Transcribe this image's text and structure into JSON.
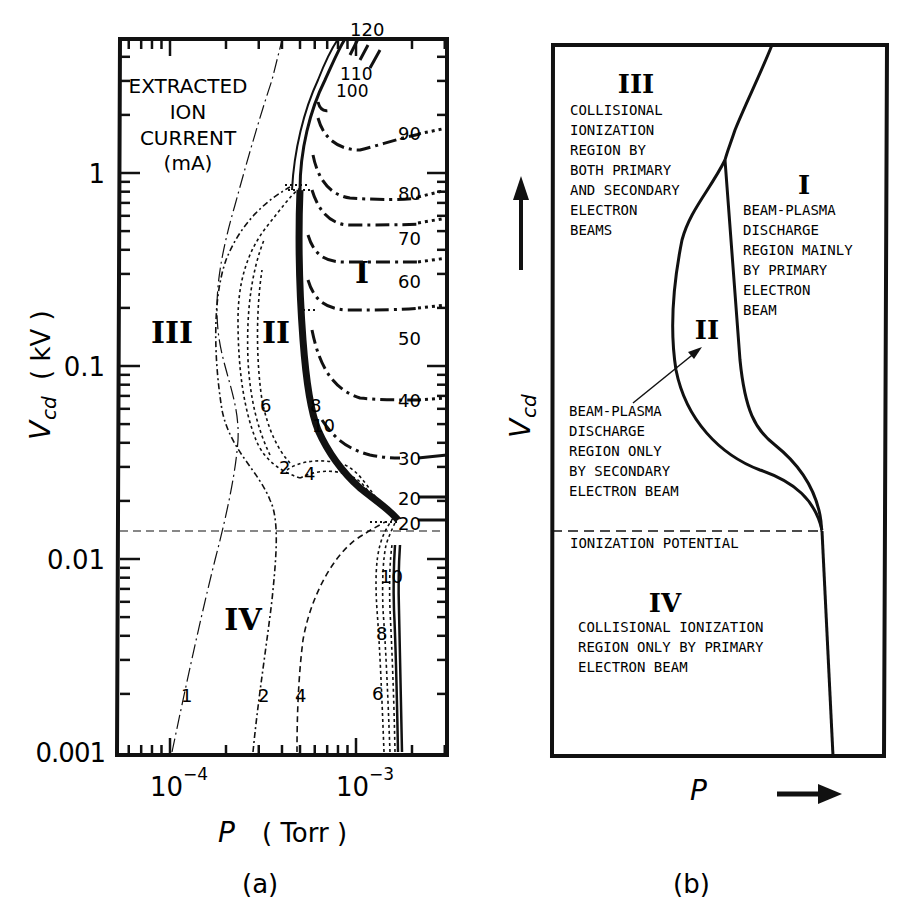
{
  "chart_data": [
    {
      "panel": "a",
      "type": "line",
      "title": "",
      "xlabel": "P (Torr)",
      "ylabel": "Vcd (kV)",
      "xscale": "log",
      "yscale": "log",
      "xlim": [
        5e-05,
        0.003
      ],
      "ylim": [
        0.001,
        5
      ],
      "x_ticks": [
        "10^-4",
        "10^-3"
      ],
      "y_ticks": [
        "0.001",
        "0.01",
        "0.1",
        "1"
      ],
      "legend_title": "EXTRACTED ION CURRENT (mA)",
      "ionization_potential_kV": 0.0145,
      "region_labels": [
        "I",
        "II",
        "III",
        "IV"
      ],
      "series": [
        {
          "name": "1 mA",
          "style": "dashdot-thin",
          "points": [
            [
              0.0001,
              0.001
            ],
            [
              0.00013,
              0.004
            ],
            [
              0.00018,
              0.012
            ],
            [
              0.00022,
              0.03
            ],
            [
              0.00021,
              0.06
            ],
            [
              0.00017,
              0.15
            ],
            [
              0.00018,
              0.35
            ],
            [
              0.00026,
              1.0
            ],
            [
              0.00035,
              2.5
            ],
            [
              0.00042,
              5
            ]
          ]
        },
        {
          "name": "2 mA",
          "style": "dashdot",
          "points": [
            [
              0.00027,
              0.001
            ],
            [
              0.00032,
              0.004
            ],
            [
              0.00036,
              0.012
            ],
            [
              0.00035,
              0.025
            ],
            [
              0.00028,
              0.05
            ],
            [
              0.00025,
              0.1
            ],
            [
              0.00024,
              0.2
            ],
            [
              0.00028,
              0.5
            ],
            [
              0.00038,
              0.85
            ],
            [
              0.00046,
              0.9
            ]
          ]
        },
        {
          "name": "4 mA",
          "style": "dashed",
          "points": [
            [
              0.00048,
              0.001
            ],
            [
              0.0005,
              0.003
            ],
            [
              0.00058,
              0.007
            ],
            [
              0.00085,
              0.013
            ],
            [
              0.00118,
              0.018
            ]
          ]
        },
        {
          "name": "6 mA",
          "style": "dotted-bundle",
          "points": [
            [
              0.00125,
              0.001
            ],
            [
              0.0012,
              0.006
            ],
            [
              0.00123,
              0.017
            ]
          ]
        },
        {
          "name": "8 mA",
          "style": "dotted-bundle",
          "points": [
            [
              0.00135,
              0.001
            ],
            [
              0.0013,
              0.006
            ],
            [
              0.0013,
              0.017
            ]
          ]
        },
        {
          "name": "10 mA",
          "style": "dotted-bundle",
          "points": [
            [
              0.00145,
              0.001
            ],
            [
              0.0014,
              0.006
            ],
            [
              0.0014,
              0.017
            ]
          ]
        },
        {
          "name": "20 mA",
          "style": "solid",
          "points": [
            [
              0.0016,
              0.001
            ],
            [
              0.0015,
              0.006
            ],
            [
              0.00148,
              0.014
            ]
          ]
        },
        {
          "name": "30 mA",
          "style": "dashdot-heavy",
          "points": [
            [
              0.00065,
              0.06
            ],
            [
              0.0008,
              0.04
            ],
            [
              0.0012,
              0.031
            ],
            [
              0.0016,
              0.03
            ]
          ]
        },
        {
          "name": "40 mA",
          "style": "dashdot-heavy",
          "points": [
            [
              0.0006,
              0.1
            ],
            [
              0.0007,
              0.07
            ],
            [
              0.001,
              0.058
            ],
            [
              0.0018,
              0.058
            ]
          ]
        },
        {
          "name": "50 mA",
          "style": "dashdot-heavy",
          "points": [
            [
              0.00057,
              0.4
            ],
            [
              0.00065,
              0.23
            ],
            [
              0.0009,
              0.21
            ],
            [
              0.0018,
              0.215
            ]
          ]
        },
        {
          "name": "60 mA",
          "style": "dashdot-heavy",
          "points": [
            [
              0.00055,
              0.8
            ],
            [
              0.00065,
              0.5
            ],
            [
              0.0009,
              0.47
            ],
            [
              0.0018,
              0.47
            ]
          ]
        },
        {
          "name": "70 mA",
          "style": "dashdot-heavy",
          "points": [
            [
              0.00055,
              1.2
            ],
            [
              0.00065,
              0.9
            ],
            [
              0.0009,
              0.8
            ],
            [
              0.0018,
              0.8
            ]
          ]
        },
        {
          "name": "80 mA",
          "style": "dashdot-heavy",
          "points": [
            [
              0.00058,
              2.0
            ],
            [
              0.00068,
              1.4
            ],
            [
              0.0009,
              1.3
            ],
            [
              0.0018,
              1.3
            ]
          ]
        },
        {
          "name": "90 mA",
          "style": "dashdot-heavy",
          "points": [
            [
              0.0006,
              3.0
            ],
            [
              0.0007,
              2.3
            ],
            [
              0.0012,
              2.8
            ],
            [
              0.0018,
              3.0
            ]
          ]
        },
        {
          "name": "100 mA",
          "style": "dashdot-heavy",
          "points": [
            [
              0.00065,
              3.5
            ],
            [
              0.00075,
              3.5
            ]
          ]
        },
        {
          "name": "110 mA",
          "style": "dashdot-heavy",
          "points": [
            [
              0.00072,
              4.2
            ],
            [
              0.0008,
              4.0
            ]
          ]
        },
        {
          "name": "120 mA",
          "style": "dashdot-heavy",
          "points": [
            [
              0.00085,
              5
            ],
            [
              0.00095,
              4.7
            ]
          ]
        }
      ]
    },
    {
      "panel": "b",
      "type": "diagram",
      "xlabel": "P",
      "ylabel": "Vcd",
      "regions": [
        {
          "id": "III",
          "description": "COLLISIONAL IONIZATION REGION BY BOTH PRIMARY AND SECONDARY ELECTRON BEAMS"
        },
        {
          "id": "I",
          "description": "BEAM-PLASMA DISCHARGE REGION MAINLY BY PRIMARY ELECTRON BEAM"
        },
        {
          "id": "II",
          "description": "BEAM-PLASMA DISCHARGE REGION ONLY BY SECONDARY ELECTRON BEAM"
        },
        {
          "id": "IV",
          "description": "COLLISIONAL IONIZATION REGION ONLY BY PRIMARY ELECTRON BEAM"
        }
      ],
      "ionization_potential_label": "IONIZATION POTENTIAL"
    }
  ],
  "panel_a": {
    "caption": "(a)",
    "x_axis_label_var": "P",
    "x_axis_label_unit": "( Torr )",
    "y_axis_label_var": "V",
    "y_axis_label_sub": "cd",
    "y_axis_label_unit": "( kV )",
    "y_tick_labels": {
      "t1": "1",
      "t01": "0.1",
      "t001": "0.01",
      "t0001": "0.001"
    },
    "x_tick_labels": {
      "base": "10",
      "e4": "−4",
      "e3": "−3"
    },
    "legend_lines": [
      "EXTRACTED",
      "ION",
      "CURRENT",
      "(mA)"
    ],
    "regions": {
      "I": "I",
      "II": "II",
      "III": "III",
      "IV": "IV"
    },
    "curve_labels": {
      "c120": "120",
      "c110": "110",
      "c100": "100",
      "c90": "90",
      "c80": "80",
      "c70": "70",
      "c60": "60",
      "c50": "50",
      "c40": "40",
      "c30": "30",
      "c20a": "20",
      "c20b": "20",
      "c10a": "10",
      "c10b": "10",
      "c8a": "8",
      "c8b": "8",
      "c6a": "6",
      "c6b": "6",
      "c4a": "4",
      "c4b": "4",
      "c2a": "2",
      "c2b": "2",
      "c1": "1"
    }
  },
  "panel_b": {
    "caption": "(b)",
    "x_axis_label": "P",
    "y_axis_label_var": "V",
    "y_axis_label_sub": "cd",
    "region_III": {
      "numeral": "III",
      "lines": [
        "COLLISIONAL",
        "IONIZATION",
        "REGION BY",
        "BOTH PRIMARY",
        "AND SECONDARY",
        "ELECTRON",
        "BEAMS"
      ]
    },
    "region_I": {
      "numeral": "I",
      "lines": [
        "BEAM-PLASMA",
        "DISCHARGE",
        "REGION MAINLY",
        "BY PRIMARY",
        "ELECTRON",
        "BEAM"
      ]
    },
    "region_II": {
      "numeral": "II",
      "lines": [
        "BEAM-PLASMA",
        "DISCHARGE",
        "REGION ONLY",
        "BY SECONDARY",
        "ELECTRON BEAM"
      ]
    },
    "region_IV": {
      "numeral": "IV",
      "lines": [
        "COLLISIONAL IONIZATION",
        "REGION ONLY BY PRIMARY",
        "ELECTRON BEAM"
      ]
    },
    "ionization_label": "IONIZATION POTENTIAL"
  }
}
